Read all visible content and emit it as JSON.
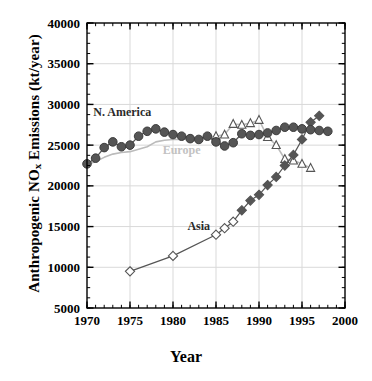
{
  "chart_data": {
    "type": "line",
    "title": "",
    "xlabel": "Year",
    "ylabel_parts": {
      "pre": "Anthropogenic NO",
      "sub": "x",
      "post": " Emissions (kt/year)"
    },
    "ylabel": "Anthropogenic NOx Emissions (kt/year)",
    "xlim": [
      1970,
      2000
    ],
    "ylim": [
      5000,
      40000
    ],
    "xticks": [
      1970,
      1975,
      1980,
      1985,
      1990,
      1995,
      2000
    ],
    "yticks": [
      5000,
      10000,
      15000,
      20000,
      25000,
      30000,
      35000,
      40000
    ],
    "xtick_labels": [
      "1970",
      "1975",
      "1980",
      "1985",
      "1990",
      "1995",
      "2000"
    ],
    "ytick_labels": [
      "5000",
      "10000",
      "15000",
      "20000",
      "25000",
      "30000",
      "35000",
      "40000"
    ],
    "x_minor_tick_interval": 1,
    "y_minor_tick_interval": 1250,
    "grid": true,
    "grid_color": "#d9d9d9",
    "legend_position": "inline-annotations",
    "series": [
      {
        "name": "N. America",
        "label": "N. America",
        "marker": "filled-circle",
        "color": "#555555",
        "line_color": "#555555",
        "label_color": "#2b2b2b",
        "label_x": 1974.1,
        "label_y": 28600,
        "x": [
          1970,
          1971,
          1972,
          1973,
          1974,
          1975,
          1976,
          1977,
          1978,
          1979,
          1980,
          1981,
          1982,
          1983,
          1984,
          1985,
          1986,
          1987,
          1988,
          1989,
          1990,
          1991,
          1992,
          1993,
          1994,
          1995,
          1996,
          1997,
          1998
        ],
        "values": [
          22700,
          23400,
          24700,
          25400,
          24800,
          25000,
          26100,
          26700,
          27000,
          26600,
          26300,
          26100,
          25800,
          25700,
          26100,
          25400,
          24900,
          25300,
          26400,
          26200,
          26300,
          26500,
          26800,
          27200,
          27200,
          27000,
          26900,
          26800,
          26700
        ]
      },
      {
        "name": "Europe",
        "label": "Europe",
        "marker": "open-triangle",
        "color": "#555555",
        "line_color": "#bbbbbb",
        "label_color": "#c2c2c2",
        "label_x": 1981.0,
        "label_y": 23900,
        "x": [
          1970,
          1971,
          1972,
          1973,
          1974,
          1975,
          1976,
          1977,
          1978,
          1979,
          1980,
          1981,
          1982,
          1983,
          1984,
          1985,
          1986,
          1987,
          1988,
          1989,
          1990,
          1991,
          1992,
          1993,
          1994,
          1995,
          1996,
          1997,
          1998
        ],
        "values": [
          22600,
          23000,
          23500,
          23900,
          24100,
          24200,
          24500,
          24800,
          25400,
          25600,
          25700,
          25700,
          25800,
          25900,
          26000,
          26100,
          26300,
          27600,
          27500,
          27700,
          28100,
          26000,
          25000,
          23300,
          23100,
          22700,
          22200,
          null,
          null
        ],
        "marker_x": [
          1985,
          1986,
          1987,
          1988,
          1989,
          1990,
          1991,
          1992,
          1993,
          1994,
          1995,
          1996
        ],
        "marker_values": [
          26100,
          26300,
          27600,
          27500,
          27700,
          28100,
          26000,
          25000,
          23300,
          23100,
          22700,
          22200
        ]
      },
      {
        "name": "Asia",
        "label": "Asia",
        "marker": "filled-diamond",
        "open_marker": "open-diamond",
        "color": "#555555",
        "line_color": "#555555",
        "label_color": "#2b2b2b",
        "label_x": 1983.0,
        "label_y": 14600,
        "x": [
          1975,
          1980,
          1985,
          1986,
          1987,
          1988,
          1989,
          1990,
          1991,
          1992,
          1993,
          1994,
          1995,
          1996,
          1997
        ],
        "values": [
          9500,
          11400,
          14000,
          14800,
          15600,
          17000,
          18200,
          18900,
          20100,
          21100,
          22500,
          23800,
          25700,
          27800,
          28600
        ],
        "open_points_x": [
          1975,
          1980,
          1985,
          1986,
          1987
        ],
        "open_points_values": [
          9500,
          11400,
          14000,
          14800,
          15600
        ]
      }
    ]
  },
  "axes": {
    "frame_color": "#000000",
    "background": "#ffffff"
  }
}
